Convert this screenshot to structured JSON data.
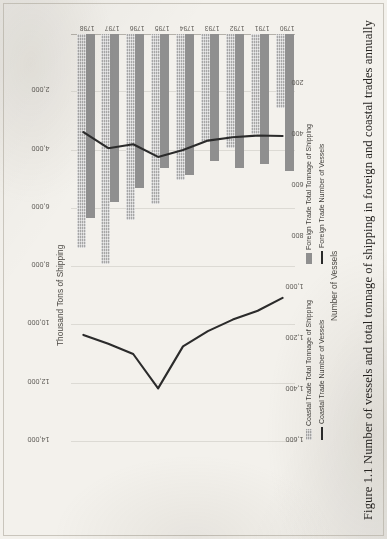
{
  "caption": "Figure 1.1 Number of vessels and total tonnage of shipping in foreign and coastal trades annually",
  "chart_data": {
    "type": "bar",
    "title": "",
    "orientation": "horizontal",
    "categories": [
      "1790",
      "1791",
      "1792",
      "1793",
      "1794",
      "1795",
      "1796",
      "1797",
      "1798"
    ],
    "top_axis": {
      "label": "Thousand Tons of Shipping",
      "ticks": [
        "14,000",
        "12,000",
        "10,000",
        "8,000",
        "6,000",
        "4,000",
        "2,000"
      ],
      "tick_values": [
        14000,
        12000,
        10000,
        8000,
        6000,
        4000,
        2000
      ],
      "range": [
        0,
        14000
      ],
      "direction": "descending-left-to-right"
    },
    "bottom_axis": {
      "label": "Number of Vessels",
      "ticks": [
        "1,600",
        "1,400",
        "1,200",
        "1,000",
        "800",
        "600",
        "400",
        "200"
      ],
      "tick_values": [
        1600,
        1400,
        1200,
        1000,
        800,
        600,
        400,
        200
      ],
      "range": [
        0,
        1600
      ],
      "direction": "descending-left-to-right"
    },
    "grid": true,
    "legend_position": "bottom",
    "series": [
      {
        "name": "Coastal Trade  Total Tonnage of Shipping",
        "kind": "bar",
        "axis": "top",
        "color": "#a6a6a6",
        "values": [
          2550,
          3450,
          3900,
          3700,
          5000,
          5850,
          6400,
          7900,
          7350
        ]
      },
      {
        "name": "Foreign Trade  Total Tonnage of Shipping",
        "kind": "bar",
        "axis": "top",
        "color": "#8f8f8f",
        "values": [
          4700,
          4450,
          4600,
          4350,
          4850,
          4600,
          5300,
          5750,
          6300
        ]
      },
      {
        "name": "Coastal Trade  Number of Vessels",
        "kind": "line",
        "axis": "bottom",
        "color": "#2b2b2b",
        "values": [
          1035,
          1085,
          1120,
          1165,
          1225,
          1390,
          1255,
          1215,
          1180
        ]
      },
      {
        "name": "Foreign Trade  Number of Vessels",
        "kind": "line",
        "axis": "bottom",
        "color": "#2b2b2b",
        "values": [
          400,
          398,
          405,
          418,
          455,
          482,
          432,
          448,
          385
        ]
      }
    ],
    "legend": [
      "Coastal Trade  Total Tonnage of Shipping",
      "Coastal Trade  Number of Vessels",
      "Foreign Trade  Total Tonnage of Shipping",
      "Foreign Trade  Number of Vessels"
    ]
  }
}
